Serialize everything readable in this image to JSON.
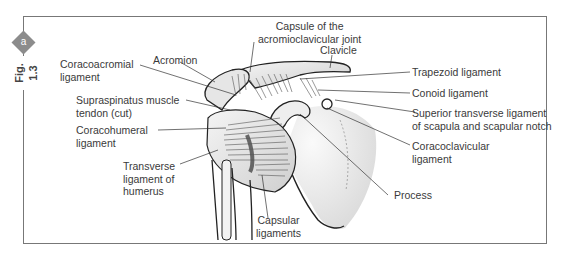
{
  "figure": {
    "number": "Fig. 1.3",
    "panel_badge": "a",
    "badge_color": "#8c8c8c",
    "frame_color": "#777777"
  },
  "labels": {
    "capsule_ac_joint": {
      "line1": "Capsule of the",
      "line2": "acromioclavicular joint"
    },
    "clavicle": "Clavicle",
    "acromion": "Acromion",
    "coracoacromial": {
      "line1": "Coracoacromial",
      "line2": "ligament"
    },
    "trapezoid": "Trapezoid ligament",
    "conoid": "Conoid ligament",
    "superior_transverse": {
      "line1": "Superior transverse ligament",
      "line2": "of scapula and scapular notch"
    },
    "supraspinatus": {
      "line1": "Supraspinatus muscle",
      "line2": "tendon (cut)"
    },
    "coracoclavicular": {
      "line1": "Coracoclavicular",
      "line2": "ligament"
    },
    "coracohumeral": {
      "line1": "Coracohumeral",
      "line2": "ligament"
    },
    "transverse_humerus": {
      "line1": "Transverse",
      "line2": "ligament of",
      "line3": "humerus"
    },
    "process": "Process",
    "capsular": {
      "line1": "Capsular",
      "line2": "ligaments"
    }
  }
}
